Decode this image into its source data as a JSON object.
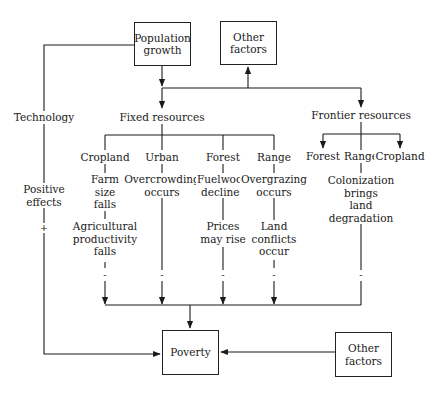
{
  "diagram": {
    "nodes": {
      "population_growth": "Population\ngrowth",
      "other_factors_top": "Other\nfactors",
      "technology": "Technology",
      "fixed_resources": "Fixed resources",
      "frontier_resources": "Frontier resources",
      "positive_effects": "Positive\neffects",
      "plus_sign": "+",
      "fixed": {
        "cropland": "Cropland",
        "urban": "Urban",
        "forest": "Forest",
        "range": "Range"
      },
      "frontier": {
        "forest": "Forest",
        "range": "Range",
        "cropland": "Cropland"
      },
      "effects": {
        "farm_size_falls": "Farm\nsize\nfalls",
        "agricultural_productivity_falls": "Agricultural\nproductivity\nfalls",
        "overcrowding_occurs": "Overcrowding\noccurs",
        "fuelwood_declines": "Fuelwood\ndeclines",
        "prices_may_rise": "Prices\nmay rise",
        "overgrazing_occurs": "Overgrazing\noccurs",
        "land_conflicts_occur": "Land\nconflicts\noccur",
        "colonization": "Colonization\nbrings\nland degradation"
      },
      "minus_sign": "-",
      "poverty": "Poverty",
      "other_factors_bottom": "Other\nfactors"
    },
    "edges": [
      {
        "from": "Population growth",
        "to": "Fixed resources"
      },
      {
        "from": "Population growth",
        "to": "Other factors"
      },
      {
        "from": "Population growth",
        "to": "Frontier resources"
      },
      {
        "from": "Population growth",
        "to": "Technology"
      },
      {
        "from": "Technology",
        "to": "Poverty",
        "sign": "+",
        "label": "Positive effects"
      },
      {
        "from": "Fixed resources",
        "to": "Cropland"
      },
      {
        "from": "Fixed resources",
        "to": "Urban"
      },
      {
        "from": "Fixed resources",
        "to": "Forest"
      },
      {
        "from": "Fixed resources",
        "to": "Range"
      },
      {
        "from": "Frontier resources",
        "to": "Forest (frontier)"
      },
      {
        "from": "Frontier resources",
        "to": "Range (frontier)"
      },
      {
        "from": "Frontier resources",
        "to": "Cropland (frontier)"
      },
      {
        "from": "Agricultural productivity falls",
        "to": "Poverty",
        "sign": "-"
      },
      {
        "from": "Overcrowding occurs",
        "to": "Poverty",
        "sign": "-"
      },
      {
        "from": "Prices may rise",
        "to": "Poverty",
        "sign": "-"
      },
      {
        "from": "Land conflicts occur",
        "to": "Poverty",
        "sign": "-"
      },
      {
        "from": "Colonization brings land degradation",
        "to": "Poverty",
        "sign": "-"
      },
      {
        "from": "Other factors",
        "to": "Poverty"
      }
    ]
  }
}
